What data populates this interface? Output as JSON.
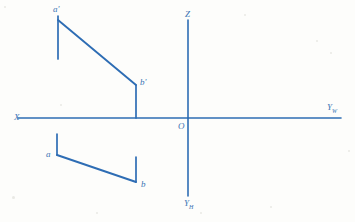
{
  "figure": {
    "background_color": "#fdfdfb",
    "line_color": "#2E6DB4",
    "label_color": "#3B74B4"
  },
  "axes": {
    "x_axis": {
      "label": "X",
      "label_x": 14,
      "label_y": 113,
      "x1": 18,
      "y1": 118,
      "x2": 341,
      "y2": 118
    },
    "z_axis": {
      "label": "Z",
      "label_x": 185,
      "label_y": 10,
      "x1": 188,
      "y1": 20,
      "x2": 188,
      "y2": 118
    },
    "y_w_axis": {
      "label": "Y",
      "subscript": "W",
      "label_x": 327,
      "label_y": 103,
      "x1": 188,
      "y1": 118,
      "x2": 341,
      "y2": 118
    },
    "y_h_axis": {
      "label": "Y",
      "subscript": "H",
      "label_x": 184,
      "label_y": 199,
      "x1": 188,
      "y1": 118,
      "x2": 188,
      "y2": 196
    },
    "origin": {
      "label": "O",
      "label_x": 178,
      "label_y": 122
    }
  },
  "front_view": {
    "name": "front-view-projection",
    "points": [
      {
        "label": "a'",
        "label_x": 53,
        "label_y": 5,
        "x": 58,
        "y": 16
      },
      {
        "label": "b'",
        "label_x": 140,
        "label_y": 78,
        "x": 136,
        "y": 85
      }
    ],
    "segments": [
      {
        "name": "a-prime-tick",
        "x1": 58,
        "y1": 16,
        "x2": 58,
        "y2": 59
      },
      {
        "name": "a-prime-b-prime-line",
        "x1": 58,
        "y1": 20,
        "x2": 136,
        "y2": 85
      },
      {
        "name": "b-prime-tick",
        "x1": 136,
        "y1": 85,
        "x2": 136,
        "y2": 118
      }
    ]
  },
  "top_view": {
    "name": "top-view-projection",
    "points": [
      {
        "label": "a",
        "label_x": 46,
        "label_y": 150,
        "x": 57,
        "y": 155
      },
      {
        "label": "b",
        "label_x": 141,
        "label_y": 180,
        "x": 136,
        "y": 182
      }
    ],
    "segments": [
      {
        "name": "a-tick",
        "x1": 57,
        "y1": 134,
        "x2": 57,
        "y2": 155
      },
      {
        "name": "a-b-line",
        "x1": 57,
        "y1": 155,
        "x2": 136,
        "y2": 182
      },
      {
        "name": "b-tick",
        "x1": 136,
        "y1": 182,
        "x2": 136,
        "y2": 157
      }
    ]
  },
  "specks": [
    {
      "x": 4,
      "y": 6,
      "s": 2
    },
    {
      "x": 316,
      "y": 40,
      "s": 2
    },
    {
      "x": 330,
      "y": 52,
      "s": 2
    },
    {
      "x": 12,
      "y": 196,
      "s": 3
    },
    {
      "x": 270,
      "y": 206,
      "s": 2
    },
    {
      "x": 96,
      "y": 212,
      "s": 2
    },
    {
      "x": 200,
      "y": 212,
      "s": 2
    },
    {
      "x": 348,
      "y": 150,
      "s": 2
    },
    {
      "x": 60,
      "y": 104,
      "s": 2
    },
    {
      "x": 244,
      "y": 14,
      "s": 2
    }
  ]
}
